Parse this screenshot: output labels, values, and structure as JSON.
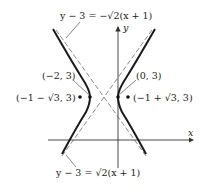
{
  "figure": {
    "type": "hyperbola",
    "equation_implied": "(x+1)^2 - (y-3)^2/2 = 1",
    "center": [
      -1,
      3
    ],
    "axes": {
      "x_label": "x",
      "y_label": "y"
    },
    "asymptote_labels": {
      "top": "y − 3 = −√2(x + 1)",
      "bottom": "y − 3 = √2(x + 1)"
    },
    "vertices": [
      {
        "label": "(−2, 3)",
        "x": -2,
        "y": 3
      },
      {
        "label": "(0, 3)",
        "x": 0,
        "y": 3
      }
    ],
    "foci": [
      {
        "label": "(−1 − √3, 3)",
        "x": -2.732,
        "y": 3
      },
      {
        "label": "(−1 + √3, 3)",
        "x": 0.732,
        "y": 3
      }
    ],
    "colors": {
      "curve": "#1a1a1a",
      "asymptote": "#555555",
      "axis": "#333333"
    }
  }
}
